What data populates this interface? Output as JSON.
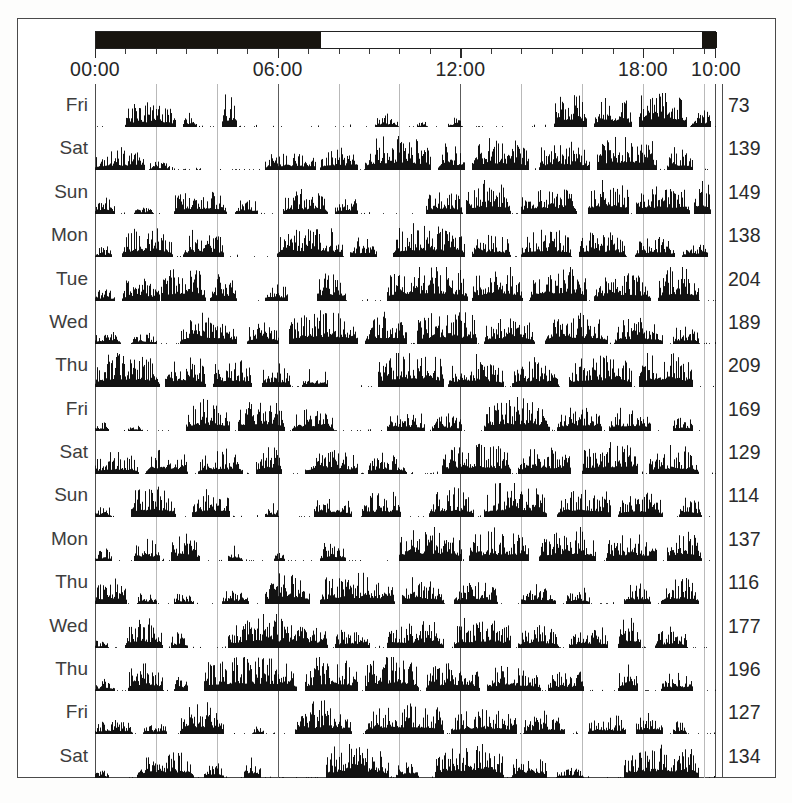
{
  "figure": {
    "type": "actogram",
    "title": ""
  },
  "daynight_bar": {
    "name": "day-night-bar",
    "segments": [
      {
        "label": "night",
        "start_hour": 0.0,
        "end_hour": 7.4,
        "color": "#17140f"
      },
      {
        "label": "day",
        "start_hour": 7.4,
        "end_hour": 19.9,
        "color": "#ffffff"
      },
      {
        "label": "night",
        "start_hour": 19.9,
        "end_hour": 20.4,
        "color": "#17140f"
      }
    ]
  },
  "time_axis": {
    "start_hour": 0,
    "end_hour": 20.4,
    "tick_interval_hours": 1,
    "major_tick_interval_hours": 6,
    "labels": [
      {
        "text": "00:00",
        "hour": 0
      },
      {
        "text": "06:00",
        "hour": 6
      },
      {
        "text": "12:00",
        "hour": 12
      },
      {
        "text": "18:00",
        "hour": 18
      },
      {
        "text": "10:00",
        "hour": 20.4
      }
    ]
  },
  "grid": {
    "interval_hours": 2,
    "strong_at_hours": [
      6,
      12
    ]
  },
  "chart_data": {
    "type": "bar",
    "title": "",
    "xlabel": "",
    "ylabel": "",
    "xlim": [
      0,
      20.4
    ],
    "grid": true,
    "legend": "none",
    "categories": [
      "Fri",
      "Sat",
      "Sun",
      "Mon",
      "Tue",
      "Wed",
      "Thu",
      "Fri",
      "Sat",
      "Sun",
      "Mon",
      "Thu",
      "Wed",
      "Thu",
      "Fri",
      "Sat"
    ],
    "values": [
      73,
      139,
      149,
      138,
      204,
      189,
      209,
      169,
      129,
      114,
      137,
      116,
      177,
      196,
      127,
      134
    ],
    "series": [
      {
        "name": "Fri",
        "total": 73,
        "bouts": [
          [
            1.0,
            2.6,
            0.55
          ],
          [
            2.9,
            3.3,
            0.35
          ],
          [
            4.2,
            4.6,
            0.75
          ],
          [
            9.2,
            9.9,
            0.3
          ],
          [
            10.6,
            10.9,
            0.15
          ],
          [
            11.6,
            12.0,
            0.22
          ],
          [
            15.1,
            16.1,
            0.85
          ],
          [
            16.4,
            17.6,
            0.7
          ],
          [
            17.9,
            19.4,
            0.95
          ],
          [
            19.6,
            20.2,
            0.45
          ]
        ]
      },
      {
        "name": "Sat",
        "total": 139,
        "bouts": [
          [
            0.0,
            1.6,
            0.5
          ],
          [
            1.8,
            2.4,
            0.22
          ],
          [
            5.6,
            7.2,
            0.45
          ],
          [
            7.4,
            8.6,
            0.55
          ],
          [
            8.9,
            11.0,
            0.8
          ],
          [
            11.3,
            12.1,
            0.6
          ],
          [
            12.4,
            14.2,
            0.75
          ],
          [
            14.6,
            16.2,
            0.65
          ],
          [
            16.5,
            18.4,
            0.85
          ],
          [
            18.8,
            19.6,
            0.5
          ]
        ]
      },
      {
        "name": "Sun",
        "total": 149,
        "bouts": [
          [
            0.0,
            0.6,
            0.45
          ],
          [
            1.3,
            1.9,
            0.2
          ],
          [
            2.6,
            4.3,
            0.6
          ],
          [
            4.6,
            5.3,
            0.4
          ],
          [
            6.2,
            7.6,
            0.55
          ],
          [
            7.9,
            8.6,
            0.38
          ],
          [
            10.9,
            12.0,
            0.62
          ],
          [
            12.2,
            13.6,
            0.8
          ],
          [
            14.0,
            15.8,
            0.7
          ],
          [
            16.2,
            17.5,
            0.88
          ],
          [
            17.8,
            19.5,
            0.75
          ],
          [
            19.7,
            20.2,
            0.9
          ]
        ]
      },
      {
        "name": "Mon",
        "total": 138,
        "bouts": [
          [
            0.0,
            0.5,
            0.25
          ],
          [
            0.9,
            2.5,
            0.7
          ],
          [
            2.9,
            4.2,
            0.62
          ],
          [
            6.0,
            8.1,
            0.7
          ],
          [
            8.4,
            9.2,
            0.45
          ],
          [
            9.8,
            12.1,
            0.78
          ],
          [
            12.4,
            13.6,
            0.55
          ],
          [
            14.0,
            15.6,
            0.68
          ],
          [
            15.9,
            17.4,
            0.6
          ],
          [
            17.8,
            19.0,
            0.5
          ],
          [
            19.3,
            20.1,
            0.35
          ]
        ]
      },
      {
        "name": "Tue",
        "total": 204,
        "bouts": [
          [
            0.0,
            0.6,
            0.3
          ],
          [
            0.9,
            2.1,
            0.55
          ],
          [
            2.2,
            3.6,
            0.85
          ],
          [
            3.8,
            4.6,
            0.6
          ],
          [
            5.6,
            6.3,
            0.45
          ],
          [
            7.3,
            8.2,
            0.72
          ],
          [
            9.6,
            12.2,
            0.88
          ],
          [
            12.4,
            14.0,
            0.8
          ],
          [
            14.3,
            16.1,
            0.9
          ],
          [
            16.4,
            18.2,
            0.7
          ],
          [
            18.5,
            19.8,
            0.78
          ]
        ]
      },
      {
        "name": "Wed",
        "total": 189,
        "bouts": [
          [
            0.0,
            0.8,
            0.35
          ],
          [
            1.2,
            2.0,
            0.25
          ],
          [
            2.8,
            4.6,
            0.68
          ],
          [
            5.0,
            6.0,
            0.55
          ],
          [
            6.4,
            8.6,
            0.82
          ],
          [
            8.9,
            10.2,
            0.7
          ],
          [
            10.6,
            12.5,
            0.78
          ],
          [
            12.8,
            14.4,
            0.65
          ],
          [
            14.8,
            16.8,
            0.72
          ],
          [
            17.1,
            18.6,
            0.58
          ],
          [
            19.0,
            19.8,
            0.4
          ]
        ]
      },
      {
        "name": "Thu",
        "total": 209,
        "bouts": [
          [
            0.0,
            2.1,
            0.85
          ],
          [
            2.3,
            3.6,
            0.75
          ],
          [
            3.9,
            5.1,
            0.7
          ],
          [
            5.5,
            6.4,
            0.55
          ],
          [
            6.8,
            7.6,
            0.4
          ],
          [
            9.3,
            11.4,
            0.95
          ],
          [
            11.6,
            13.4,
            0.72
          ],
          [
            13.7,
            15.2,
            0.68
          ],
          [
            15.6,
            17.6,
            0.78
          ],
          [
            17.9,
            19.6,
            0.85
          ]
        ]
      },
      {
        "name": "Fri",
        "total": 169,
        "bouts": [
          [
            0.0,
            0.4,
            0.22
          ],
          [
            1.1,
            1.5,
            0.18
          ],
          [
            3.0,
            4.4,
            0.72
          ],
          [
            4.7,
            6.2,
            0.8
          ],
          [
            6.5,
            7.8,
            0.55
          ],
          [
            9.6,
            10.8,
            0.48
          ],
          [
            11.1,
            12.0,
            0.38
          ],
          [
            12.8,
            14.9,
            0.78
          ],
          [
            15.2,
            16.6,
            0.62
          ],
          [
            16.9,
            18.2,
            0.55
          ],
          [
            19.0,
            19.6,
            0.35
          ]
        ]
      },
      {
        "name": "Sat",
        "total": 129,
        "bouts": [
          [
            0.0,
            1.4,
            0.5
          ],
          [
            1.7,
            3.0,
            0.62
          ],
          [
            3.4,
            4.8,
            0.55
          ],
          [
            5.3,
            6.1,
            0.7
          ],
          [
            6.9,
            8.6,
            0.6
          ],
          [
            9.0,
            10.2,
            0.48
          ],
          [
            11.4,
            13.6,
            0.75
          ],
          [
            13.9,
            15.6,
            0.68
          ],
          [
            16.0,
            17.8,
            0.8
          ],
          [
            18.2,
            19.8,
            0.62
          ]
        ]
      },
      {
        "name": "Sun",
        "total": 114,
        "bouts": [
          [
            0.0,
            0.5,
            0.25
          ],
          [
            1.2,
            2.6,
            0.78
          ],
          [
            3.2,
            4.4,
            0.72
          ],
          [
            5.6,
            6.0,
            0.3
          ],
          [
            7.2,
            8.4,
            0.55
          ],
          [
            8.8,
            10.0,
            0.6
          ],
          [
            11.0,
            12.4,
            0.68
          ],
          [
            12.8,
            14.8,
            0.8
          ],
          [
            15.2,
            16.9,
            0.7
          ],
          [
            17.2,
            18.6,
            0.62
          ],
          [
            19.2,
            19.9,
            0.48
          ]
        ]
      },
      {
        "name": "Mon",
        "total": 137,
        "bouts": [
          [
            0.0,
            0.5,
            0.3
          ],
          [
            1.3,
            2.1,
            0.55
          ],
          [
            2.5,
            3.4,
            0.62
          ],
          [
            4.4,
            4.8,
            0.35
          ],
          [
            5.9,
            6.2,
            0.2
          ],
          [
            7.4,
            8.2,
            0.45
          ],
          [
            10.0,
            12.0,
            0.85
          ],
          [
            12.3,
            14.2,
            0.72
          ],
          [
            14.6,
            16.4,
            0.78
          ],
          [
            16.8,
            18.4,
            0.68
          ],
          [
            18.8,
            19.9,
            0.75
          ]
        ]
      },
      {
        "name": "Thu",
        "total": 116,
        "bouts": [
          [
            0.0,
            1.0,
            0.6
          ],
          [
            1.4,
            2.0,
            0.25
          ],
          [
            2.6,
            3.2,
            0.3
          ],
          [
            4.2,
            5.0,
            0.35
          ],
          [
            5.6,
            7.0,
            0.78
          ],
          [
            7.4,
            9.8,
            0.7
          ],
          [
            10.1,
            11.4,
            0.6
          ],
          [
            11.8,
            13.2,
            0.55
          ],
          [
            14.0,
            15.1,
            0.48
          ],
          [
            15.5,
            16.2,
            0.38
          ],
          [
            17.4,
            18.2,
            0.55
          ],
          [
            18.6,
            19.8,
            0.62
          ]
        ]
      },
      {
        "name": "Wed",
        "total": 177,
        "bouts": [
          [
            0.0,
            0.4,
            0.2
          ],
          [
            1.0,
            2.2,
            0.72
          ],
          [
            2.5,
            3.0,
            0.4
          ],
          [
            4.4,
            7.6,
            0.75
          ],
          [
            7.9,
            9.0,
            0.5
          ],
          [
            9.6,
            11.4,
            0.62
          ],
          [
            11.8,
            13.6,
            0.7
          ],
          [
            13.9,
            15.2,
            0.55
          ],
          [
            15.6,
            16.8,
            0.5
          ],
          [
            17.2,
            17.9,
            0.8
          ],
          [
            18.4,
            19.4,
            0.45
          ]
        ]
      },
      {
        "name": "Thu",
        "total": 196,
        "bouts": [
          [
            0.0,
            0.6,
            0.3
          ],
          [
            1.1,
            2.2,
            0.7
          ],
          [
            2.6,
            3.0,
            0.4
          ],
          [
            3.6,
            6.6,
            0.85
          ],
          [
            6.9,
            8.6,
            0.78
          ],
          [
            8.9,
            10.6,
            0.88
          ],
          [
            10.9,
            12.6,
            0.7
          ],
          [
            12.9,
            14.6,
            0.62
          ],
          [
            14.9,
            16.0,
            0.5
          ],
          [
            17.2,
            17.8,
            0.68
          ],
          [
            18.6,
            19.6,
            0.45
          ]
        ]
      },
      {
        "name": "Fri",
        "total": 127,
        "bouts": [
          [
            0.0,
            1.2,
            0.35
          ],
          [
            1.6,
            2.3,
            0.28
          ],
          [
            2.8,
            4.2,
            0.8
          ],
          [
            5.2,
            5.5,
            0.22
          ],
          [
            6.6,
            8.4,
            0.72
          ],
          [
            8.9,
            11.4,
            0.78
          ],
          [
            11.7,
            13.8,
            0.62
          ],
          [
            14.1,
            15.4,
            0.5
          ],
          [
            16.2,
            17.4,
            0.42
          ],
          [
            17.8,
            18.6,
            0.55
          ],
          [
            19.0,
            19.4,
            0.35
          ]
        ]
      },
      {
        "name": "Sat",
        "total": 134,
        "bouts": [
          [
            0.0,
            0.4,
            0.2
          ],
          [
            1.4,
            3.2,
            0.68
          ],
          [
            3.6,
            4.2,
            0.4
          ],
          [
            4.9,
            5.4,
            0.55
          ],
          [
            7.6,
            9.6,
            0.78
          ],
          [
            9.9,
            10.6,
            0.45
          ],
          [
            11.2,
            13.4,
            0.82
          ],
          [
            13.7,
            14.8,
            0.6
          ],
          [
            15.2,
            16.0,
            0.3
          ],
          [
            17.4,
            19.8,
            0.8
          ]
        ]
      }
    ]
  },
  "colors": {
    "trace": "#121212",
    "grid": "#b9b9b9",
    "grid_strong": "#5c5c5c",
    "frame": "#4a4a4a",
    "label": "#3d3d3d",
    "count": "#2b2b2b",
    "night": "#17140f",
    "day": "#ffffff"
  }
}
